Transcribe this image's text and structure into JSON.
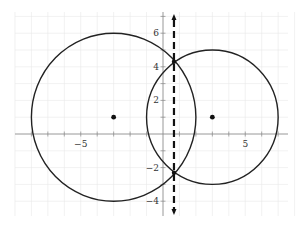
{
  "chart_data": {
    "type": "scatter",
    "title": "",
    "xlabel": "",
    "ylabel": "",
    "xlim": [
      -9.7,
      8.3
    ],
    "ylim": [
      -4.8,
      7.0
    ],
    "grid": true,
    "x_tick_labels": [
      {
        "value": -5,
        "label": "−5"
      },
      {
        "value": 5,
        "label": "5"
      }
    ],
    "y_tick_labels": [
      {
        "value": 6,
        "label": "6"
      },
      {
        "value": 4,
        "label": "4"
      },
      {
        "value": 2,
        "label": "2"
      },
      {
        "value": -2,
        "label": "−2"
      },
      {
        "value": -4,
        "label": "−4"
      }
    ],
    "circles": [
      {
        "name": "left-circle",
        "center": [
          -3,
          1
        ],
        "radius": 5
      },
      {
        "name": "right-circle",
        "center": [
          3,
          1
        ],
        "radius": 4
      }
    ],
    "center_points": [
      [
        -3,
        1
      ],
      [
        3,
        1
      ]
    ],
    "dashed_line": {
      "x": 0.667,
      "y_range": [
        -4.8,
        7.0
      ],
      "arrows": "both"
    },
    "intersection_points": [
      [
        0.667,
        4.3
      ],
      [
        0.667,
        -2.3
      ]
    ]
  }
}
